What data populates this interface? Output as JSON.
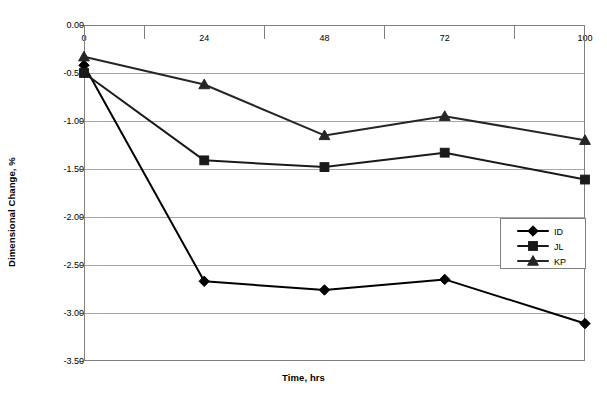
{
  "chart_data": {
    "type": "line",
    "title": "",
    "xlabel": "Time, hrs",
    "ylabel": "Dimensional Change, %",
    "x": [
      0,
      24,
      48,
      72,
      100
    ],
    "xtick_labels": [
      "0",
      "24",
      "48",
      "72",
      "100"
    ],
    "ytick_labels": [
      "0.00",
      "-0.50",
      "-1.00",
      "-1.50",
      "-2.00",
      "-2.50",
      "-3.00",
      "-3.50"
    ],
    "ytick_values": [
      0.0,
      -0.5,
      -1.0,
      -1.5,
      -2.0,
      -2.5,
      -3.0,
      -3.5
    ],
    "ylim": [
      -3.5,
      0.0
    ],
    "xlim": [
      0,
      100
    ],
    "grid": "horizontal",
    "legend_position": "inside-right",
    "xaxis_labels_position": "top",
    "series": [
      {
        "name": "ID",
        "marker": "diamond",
        "color": "#000000",
        "values": [
          -0.42,
          -2.67,
          -2.76,
          -2.65,
          -3.11
        ]
      },
      {
        "name": "JL",
        "marker": "square",
        "color": "#1a1a1a",
        "values": [
          -0.5,
          -1.41,
          -1.48,
          -1.33,
          -1.61
        ]
      },
      {
        "name": "KP",
        "marker": "triangle",
        "color": "#262626",
        "values": [
          -0.33,
          -0.62,
          -1.15,
          -0.95,
          -1.2
        ]
      }
    ]
  },
  "legend": {
    "entries": [
      "ID",
      "JL",
      "KP"
    ]
  }
}
